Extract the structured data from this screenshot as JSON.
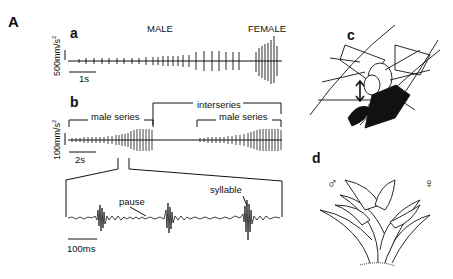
{
  "figure": {
    "panel_A_label": "A",
    "panel_a": {
      "label": "a",
      "title_male": "MALE",
      "title_female": "FEMALE",
      "y_scale": "500mm/s",
      "y_scale_sup": "2",
      "x_scale": "1s"
    },
    "panel_b": {
      "label": "b",
      "y_scale": "100mm/s",
      "y_scale_sup": "2",
      "x_scale": "2s",
      "bracket_male_series_1": "male series",
      "bracket_interseries": "interseries",
      "bracket_male_series_2": "male series"
    },
    "panel_inset": {
      "annotation_pause": "pause",
      "annotation_syllable": "syllable",
      "x_scale": "100ms"
    },
    "panel_c": {
      "label": "c"
    },
    "panel_d": {
      "label": "d",
      "male_symbol": "♂",
      "female_symbol": "♀"
    }
  }
}
